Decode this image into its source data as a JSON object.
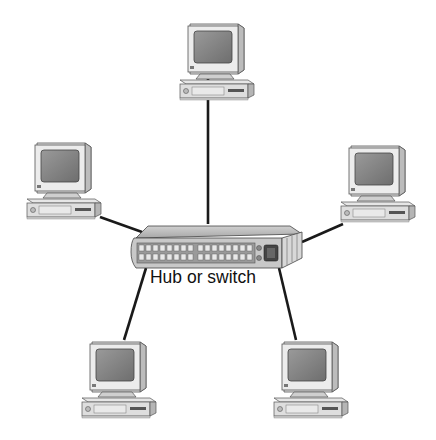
{
  "diagram": {
    "type": "star-network-topology",
    "center": {
      "label": "Hub or switch",
      "icon": "network-hub-icon"
    },
    "nodes": [
      {
        "id": "pc-top",
        "icon": "desktop-computer-icon"
      },
      {
        "id": "pc-left",
        "icon": "desktop-computer-icon"
      },
      {
        "id": "pc-right",
        "icon": "desktop-computer-icon"
      },
      {
        "id": "pc-bottom-left",
        "icon": "desktop-computer-icon"
      },
      {
        "id": "pc-bottom-right",
        "icon": "desktop-computer-icon"
      }
    ],
    "edges": [
      {
        "from": "hub",
        "to": "pc-top"
      },
      {
        "from": "hub",
        "to": "pc-left"
      },
      {
        "from": "hub",
        "to": "pc-right"
      },
      {
        "from": "hub",
        "to": "pc-bottom-left"
      },
      {
        "from": "hub",
        "to": "pc-bottom-right"
      }
    ],
    "colors": {
      "line": "#1a1a1a",
      "device_fill": "#d9d9d9",
      "screen": "#8c8c8c",
      "hub_fill": "#bdbdbd"
    }
  }
}
